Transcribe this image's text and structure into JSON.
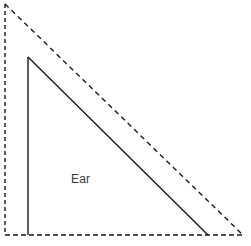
{
  "figure": {
    "title": "Ear",
    "width": 251,
    "height": 246,
    "background_color": "#ffffff",
    "labels": [
      {
        "id": "ear",
        "text": "Ear",
        "x": 71,
        "y": 173,
        "color": "#3b3b3b",
        "font_size": 12
      }
    ],
    "shapes": {
      "outer_triangle": {
        "name": "dashed-reference-triangle",
        "style": "dashed",
        "stroke_color": "#1a1a1a",
        "stroke_width": 1.4,
        "dash_pattern": "4 3",
        "vertices": [
          {
            "x": 5,
            "y": 4
          },
          {
            "x": 5,
            "y": 235
          },
          {
            "x": 243,
            "y": 235
          }
        ]
      },
      "inner_triangle": {
        "name": "solid-ear-triangle",
        "style": "solid",
        "stroke_color": "#1a1a1a",
        "stroke_width": 1.4,
        "vertices": [
          {
            "x": 28,
            "y": 57
          },
          {
            "x": 28,
            "y": 235
          },
          {
            "x": 208,
            "y": 235
          }
        ]
      }
    }
  }
}
